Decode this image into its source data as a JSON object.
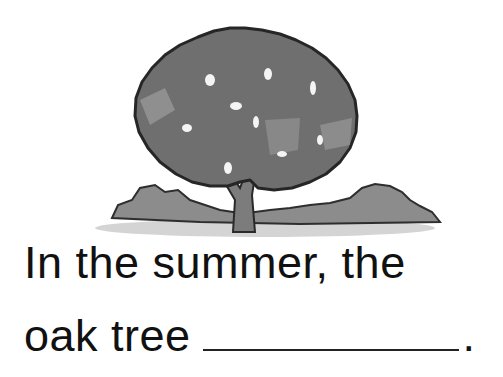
{
  "illustration": {
    "subject": "oak tree in summer",
    "icon": "tree-illustration",
    "colors": {
      "canopy": "#6e6e6e",
      "canopy_light": "#9a9a9a",
      "outline": "#2a2a2a",
      "bush": "#8a8a8a",
      "ground": "#c9c9c9",
      "trunk": "#7a7a7a"
    }
  },
  "sentence": {
    "line1": "In the summer, the",
    "line2": "oak tree",
    "blank": "",
    "period": "."
  }
}
